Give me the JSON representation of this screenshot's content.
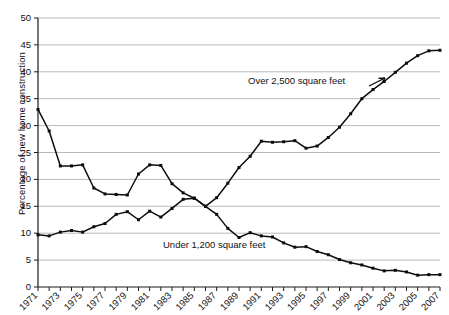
{
  "chart_data": {
    "type": "line",
    "title": "",
    "subtitle": "",
    "xlabel": "",
    "ylabel": "Percentage of new home construction",
    "ylim": [
      0,
      50
    ],
    "ytick_labels": [
      "50",
      "45",
      "40",
      "35",
      "30",
      "25",
      "20",
      "15",
      "10",
      "5",
      "0"
    ],
    "ytick_values": [
      50,
      45,
      40,
      35,
      30,
      25,
      20,
      15,
      10,
      5,
      0
    ],
    "xlim": [
      1971,
      2007
    ],
    "xtick_labels": [
      "1971",
      "1973",
      "1975",
      "1977",
      "1979",
      "1981",
      "1983",
      "1985",
      "1987",
      "1989",
      "1991",
      "1993",
      "1995",
      "1997",
      "1999",
      "2001",
      "2003",
      "2005",
      "2007"
    ],
    "xtick_values": [
      1971,
      1973,
      1975,
      1977,
      1979,
      1981,
      1983,
      1985,
      1987,
      1989,
      1991,
      1993,
      1995,
      1997,
      1999,
      2001,
      2003,
      2005,
      2007
    ],
    "x": [
      1971,
      1972,
      1973,
      1974,
      1975,
      1976,
      1977,
      1978,
      1979,
      1980,
      1981,
      1982,
      1983,
      1984,
      1985,
      1986,
      1987,
      1988,
      1989,
      1990,
      1991,
      1992,
      1993,
      1994,
      1995,
      1996,
      1997,
      1998,
      1999,
      2000,
      2001,
      2002,
      2003,
      2004,
      2005,
      2006,
      2007
    ],
    "grid": true,
    "grid_axis": "y",
    "legend": "inline-annotations",
    "legend_position": "inline",
    "series": [
      {
        "name": "Over 2,500 square feet",
        "values": [
          33,
          29,
          22.5,
          22.5,
          22.7,
          18.4,
          17.3,
          17.2,
          17.1,
          21,
          22.7,
          22.6,
          19.2,
          17.5,
          16.5,
          15,
          16.6,
          19.3,
          22.2,
          24.3,
          27.1,
          26.9,
          27,
          27.2,
          25.8,
          26.2,
          27.8,
          29.7,
          32.2,
          35,
          36.7,
          38.2,
          39.9,
          41.6,
          43,
          43.9,
          44
        ]
      },
      {
        "name": "Under 1,200 square feet",
        "values": [
          9.7,
          9.5,
          10.2,
          10.5,
          10.2,
          11.2,
          11.8,
          13.5,
          14,
          12.5,
          14.1,
          13,
          14.6,
          16.3,
          16.5,
          15,
          13.5,
          10.9,
          9.2,
          10.1,
          9.5,
          9.3,
          8.2,
          7.4,
          7.5,
          6.6,
          6,
          5.1,
          4.5,
          4.1,
          3.5,
          3,
          3.1,
          2.8,
          2.2,
          2.3,
          2.3
        ]
      }
    ],
    "annotations": [
      {
        "text": "Over 2,500 square feet",
        "series": "Over 2,500 square feet",
        "near_x": 1996,
        "near_y": 36
      },
      {
        "text": "Under 1,200 square feet",
        "series": "Under 1,200 square feet",
        "near_x": 1987,
        "near_y": 5.5
      }
    ]
  }
}
